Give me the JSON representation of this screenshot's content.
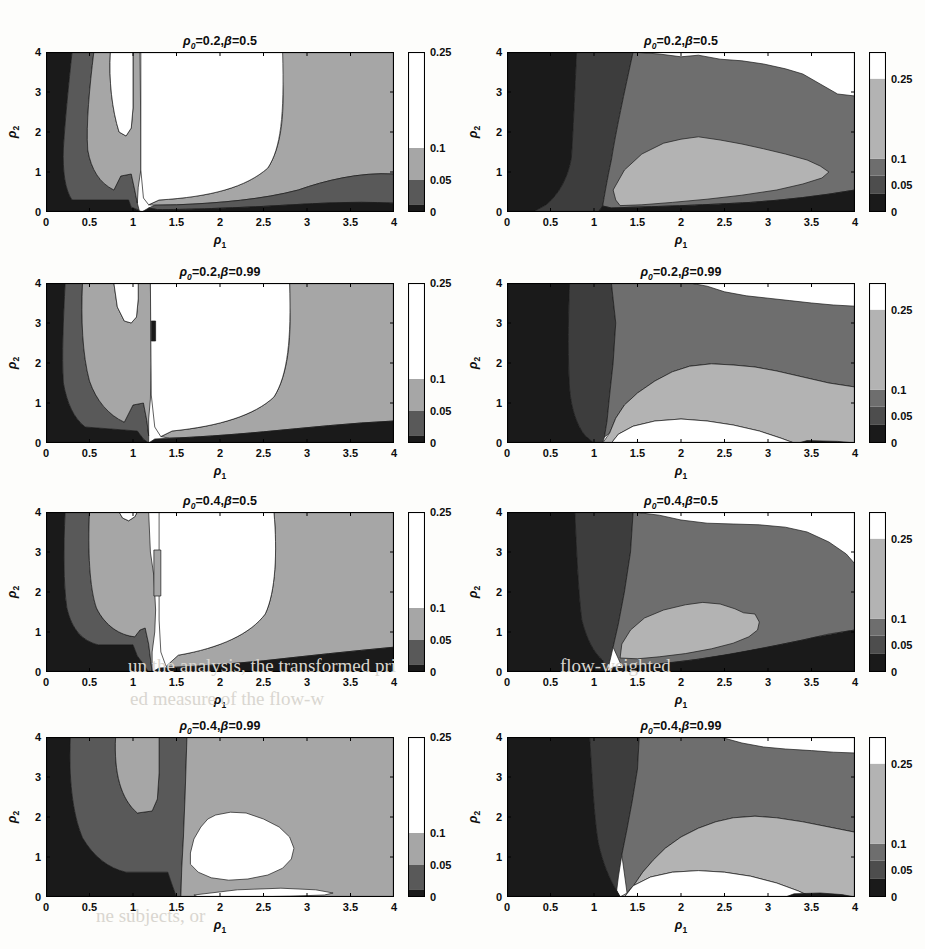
{
  "figure": {
    "width": 925,
    "height": 949,
    "background": "#fdfdfb",
    "rows": 4,
    "cols": 2
  },
  "axis": {
    "x_label": "ρ",
    "x_label_sub": "1",
    "y_label": "ρ",
    "y_label_sub": "2",
    "x_ticks": [
      "0",
      "0.5",
      "1",
      "1.5",
      "2",
      "2.5",
      "3",
      "3.5",
      "4"
    ],
    "x_tick_values": [
      0,
      0.5,
      1,
      1.5,
      2,
      2.5,
      3,
      3.5,
      4
    ],
    "y_ticks": [
      "0",
      "1",
      "2",
      "3",
      "4"
    ],
    "y_tick_values": [
      0,
      1,
      2,
      3,
      4
    ],
    "xlim": [
      0,
      4
    ],
    "ylim": [
      0,
      4
    ]
  },
  "palette": {
    "band_0": "#1a1a1a",
    "band_1": "#4d4d4d",
    "band_2": "#808080",
    "band_3": "#bfbfbf",
    "band_4": "#ffffff",
    "axis_line": "#000000",
    "contour_line": "#1a1a1a",
    "text": "#0d0d0d"
  },
  "colorbars": {
    "left": {
      "ticks": [
        "0",
        "0.05",
        "0.1",
        "0.25"
      ],
      "tick_values": [
        0,
        0.05,
        0.1,
        0.25
      ],
      "vmin": 0,
      "vmax": 0.25,
      "bands": [
        {
          "from": 0.0,
          "to": 0.012,
          "color": "#1a1a1a"
        },
        {
          "from": 0.012,
          "to": 0.05,
          "color": "#595959"
        },
        {
          "from": 0.05,
          "to": 0.1,
          "color": "#a6a6a6"
        },
        {
          "from": 0.1,
          "to": 0.25,
          "color": "#ffffff"
        }
      ]
    },
    "right": {
      "ticks": [
        "0",
        "0.05",
        "0.1",
        "0.25"
      ],
      "tick_values": [
        0,
        0.05,
        0.1,
        0.25
      ],
      "vmin": 0,
      "vmax": 0.3,
      "bands": [
        {
          "from": 0.0,
          "to": 0.035,
          "color": "#1a1a1a"
        },
        {
          "from": 0.035,
          "to": 0.068,
          "color": "#4d4d4d"
        },
        {
          "from": 0.068,
          "to": 0.1,
          "color": "#6e6e6e"
        },
        {
          "from": 0.1,
          "to": 0.25,
          "color": "#b3b3b3"
        },
        {
          "from": 0.25,
          "to": 0.3,
          "color": "#ffffff"
        }
      ]
    }
  },
  "chart_data": {
    "type": "heatmap",
    "title": "",
    "xlabel": "ρ₁",
    "ylabel": "ρ₂",
    "xlim": [
      0,
      4
    ],
    "ylim": [
      0,
      4
    ],
    "grid": false,
    "legend": "colorbar-right-of-each-panel",
    "contour_levels": [
      0,
      0.05,
      0.1,
      0.25
    ],
    "panels": [
      {
        "id": "r1c1",
        "row": 1,
        "col": 1,
        "title": "ρ₀=0.2,β=0.5",
        "rho0": 0.2,
        "beta": 0.5,
        "colorbar": "left",
        "regions": [
          {
            "level": "0-0.05",
            "color": "#1a1a1a",
            "path": "M0,4 L0.30,4 C0.26,3.2 0.22,2.3 0.20,1.6 C0.19,1.0 0.22,0.55 0.30,0.30 L0.95,0.30 L0.98,0.12 L1.06,0.05 L1.10,0 L0,0 Z"
          },
          {
            "level": "0.05-0.1",
            "color": "#595959",
            "path": "M0.30,4 L0.55,4 C0.50,3.1 0.46,2.2 0.48,1.55 C0.52,1.05 0.62,0.72 0.78,0.55 L0.86,0.90 L0.98,0.95 L1.02,0.55 L1.05,0.22 L1.07,0.05 L0.98,0.12 L0.95,0.30 L0.30,0.30 C0.22,0.55 0.19,1.0 0.20,1.6 C0.22,2.3 0.26,3.2 0.30,4 Z"
          },
          {
            "level": "0.1-0.25",
            "color": "#a6a6a6",
            "path": "M0.55,4 L0.74,4 C0.72,3.3 0.76,2.55 0.84,2.0 L0.92,1.9 L0.98,2.1 L1.00,2.6 L1.00,3.2 L1.00,4 L1.08,4 L1.09,2.0 L1.09,1.05 L1.06,0.62 L1.05,0.22 L1.02,0.55 L0.98,0.95 L0.86,0.90 L0.78,0.55 C0.62,0.72 0.52,1.05 0.48,1.55 C0.46,2.2 0.50,3.1 0.55,4 Z"
          },
          {
            "level": "0.1-0.25b",
            "color": "#a6a6a6",
            "path": "M2.70,4 L4,4 L4,0.95 C3.6,1.0 3.2,0.78 2.9,0.55 C2.5,0.32 2.0,0.22 1.5,0.18 L1.25,0.17 L1.18,0.18 L1.30,0.30 C1.9,0.38 2.3,0.62 2.55,1.1 C2.70,1.6 2.74,2.4 2.72,3.2 Z"
          },
          {
            "level": "0.05-0.1b",
            "color": "#595959",
            "path": "M4,0.95 L4,0.22 C3.5,0.28 3.0,0.2 2.5,0.14 C2.0,0.09 1.6,0.06 1.28,0.06 L1.18,0.10 L1.25,0.17 L1.5,0.18 C2.0,0.22 2.5,0.32 2.9,0.55 C3.2,0.78 3.6,1.0 4,0.95 Z"
          },
          {
            "level": "0-0.05b",
            "color": "#1a1a1a",
            "path": "M4,0.22 L4,0 L1.10,0 L1.18,0.10 L1.28,0.06 C1.6,0.06 2.0,0.09 2.5,0.14 C3.0,0.2 3.5,0.28 4,0.22 Z"
          },
          {
            "level": ">0.25",
            "color": "#ffffff",
            "path": "M0.74,4 L1.00,4 L1.00,3.2 L1.00,2.6 L0.98,2.1 L0.92,1.9 L0.84,2.0 C0.76,2.55 0.72,3.3 0.74,4 Z"
          },
          {
            "level": ">0.25b",
            "color": "#ffffff",
            "path": "M1.09,4 L2.72,4 C2.74,2.4 2.70,1.6 2.55,1.1 C2.3,0.62 1.9,0.38 1.30,0.30 L1.18,0.18 L1.12,0.35 L1.09,1.05 Z"
          }
        ]
      },
      {
        "id": "r1c2",
        "row": 1,
        "col": 2,
        "title": "ρ₀=0.2,β=0.5",
        "rho0": 0.2,
        "beta": 0.5,
        "colorbar": "right",
        "regions": [
          {
            "level": "0-0.05",
            "color": "#1a1a1a",
            "path": "M0,4 L0.80,4 C0.78,3.0 0.76,2.0 0.74,1.35 C0.70,0.85 0.60,0.45 0.45,0.18 L0.30,0 L0,0 Z"
          },
          {
            "level": "0.05-0.1",
            "color": "#3d3d3d",
            "path": "M0.80,4 L1.45,4 C1.35,3.0 1.25,2.0 1.20,1.30 C1.15,0.80 1.12,0.40 1.10,0.15 L1.05,0 L0.30,0 L0.45,0.18 C0.60,0.45 0.70,0.85 0.74,1.35 C0.76,2.0 0.78,3.0 0.80,4 Z"
          },
          {
            "level": "0.1-0.25",
            "color": "#6e6e6e",
            "path": "M1.45,4 L1.75,3.95 L2.0,3.88 L2.2,3.92 L2.45,3.82 L2.7,3.78 L2.95,3.70 L3.2,3.58 L3.4,3.45 L3.6,3.2 L3.8,2.95 L4,2.9 L4,0.55 C3.6,0.40 3.2,0.30 2.8,0.24 C2.3,0.18 1.8,0.14 1.45,0.12 L1.20,0.10 L1.10,0.15 C1.12,0.40 1.15,0.80 1.20,1.30 C1.25,2.0 1.35,3.0 1.45,4 Z"
          },
          {
            "level": "0.25+",
            "color": "#b3b3b3",
            "path": "M1.25,0.30 L1.22,0.55 L1.35,1.05 L1.55,1.45 L1.80,1.72 L2.0,1.82 L2.2,1.88 L2.45,1.80 L2.7,1.70 L2.95,1.58 L3.2,1.45 L3.45,1.30 L3.6,1.15 L3.7,1.0 L3.62,0.85 L3.4,0.70 L3.1,0.55 L2.7,0.42 L2.3,0.32 L1.9,0.24 L1.55,0.18 L1.30,0.16 Z"
          },
          {
            "level": "0-0.05c",
            "color": "#1a1a1a",
            "path": "M4,0.55 L4,0 L1.05,0 L1.10,0.15 L1.20,0.10 L1.45,0.12 C1.8,0.14 2.3,0.18 2.8,0.24 C3.2,0.30 3.6,0.40 4,0.55 Z"
          }
        ]
      },
      {
        "id": "r2c1",
        "row": 2,
        "col": 1,
        "title": "ρ₀=0.2,β=0.99",
        "rho0": 0.2,
        "beta": 0.99,
        "colorbar": "left",
        "regions": [
          {
            "level": "0-0.05",
            "color": "#1a1a1a",
            "path": "M0,4 L0.22,4 C0.20,3.1 0.18,2.2 0.20,1.5 C0.24,1.0 0.32,0.62 0.45,0.40 L1.05,0.30 L1.12,0.10 L1.18,0 L0,0 Z"
          },
          {
            "level": "0.05-0.1",
            "color": "#595959",
            "path": "M0.22,4 L0.42,4 C0.40,3.1 0.42,2.2 0.50,1.55 C0.58,1.05 0.72,0.70 0.90,0.52 L1.00,0.95 L1.12,1.0 L1.16,0.55 L1.18,0.18 L1.18,0 L1.12,0.10 L1.05,0.30 L0.45,0.40 C0.32,0.62 0.24,1.0 0.20,1.5 C0.18,2.2 0.20,3.1 0.22,4 Z"
          },
          {
            "level": "0.1-0.25",
            "color": "#a6a6a6",
            "path": "M0.42,4 L0.78,4 L0.82,3.4 L0.90,3.05 L0.98,3.0 L1.04,3.15 L1.06,3.6 L1.06,4 L1.20,4 L1.21,2.0 L1.20,1.1 L1.18,0.60 L1.18,0.18 L1.16,0.55 L1.12,1.0 L1.00,0.95 L0.90,0.52 C0.72,0.70 0.58,1.05 0.50,1.55 C0.42,2.2 0.40,3.1 0.42,4 Z"
          },
          {
            "level": "0.1-0.25b",
            "color": "#a6a6a6",
            "path": "M2.80,4 L4,4 L4,0.55 C3.5,0.50 3.0,0.38 2.5,0.28 C2.1,0.20 1.7,0.14 1.42,0.12 L1.32,0.16 L1.45,0.30 C2.0,0.42 2.4,0.70 2.62,1.15 C2.78,1.7 2.82,2.6 2.80,3.4 Z"
          },
          {
            "level": "0-0.05b",
            "color": "#1a1a1a",
            "path": "M4,0.55 L4,0 L1.18,0 L1.25,0.10 L1.42,0.12 C1.7,0.14 2.1,0.20 2.5,0.28 C3.0,0.38 3.5,0.50 4,0.55 Z"
          },
          {
            "level": ">0.25",
            "color": "#ffffff",
            "path": "M0.78,4 L1.06,4 L1.06,3.6 L1.04,3.15 L0.98,3.0 L0.90,3.05 L0.82,3.4 Z"
          },
          {
            "level": ">0.25b",
            "color": "#ffffff",
            "path": "M1.20,4 L2.80,4 C2.82,2.6 2.78,1.7 2.62,1.15 C2.4,0.70 2.0,0.42 1.45,0.30 L1.32,0.16 L1.25,0.40 L1.21,1.2 Z"
          },
          {
            "level": "spot",
            "color": "#1a1a1a",
            "path": "M1.21,2.55 L1.26,2.55 L1.26,3.05 L1.21,3.05 Z"
          }
        ]
      },
      {
        "id": "r2c2",
        "row": 2,
        "col": 2,
        "title": "ρ₀=0.2,β=0.99",
        "rho0": 0.2,
        "beta": 0.99,
        "colorbar": "right",
        "regions": [
          {
            "level": "0-0.05",
            "color": "#1a1a1a",
            "path": "M0,4 L0.72,4 C0.70,3.0 0.70,2.0 0.72,1.35 C0.74,0.85 0.80,0.45 0.90,0.18 L1.0,0 L0,0 Z"
          },
          {
            "level": "0.05-0.1",
            "color": "#3d3d3d",
            "path": "M0.72,4 L1.20,4 L1.25,3.0 L1.22,2.0 L1.18,1.20 L1.15,0.55 L1.12,0.15 L1.10,0 L1.0,0 L0.90,0.18 C0.80,0.45 0.74,0.85 0.72,1.35 C0.70,2.0 0.70,3.0 0.72,4 Z"
          },
          {
            "level": "0.1-0.25",
            "color": "#6e6e6e",
            "path": "M1.20,4 L2.1,4 L2.3,3.92 L2.5,3.78 L2.75,3.68 L3.0,3.62 L3.25,3.56 L3.5,3.50 L3.75,3.45 L4,3.42 L4,1.40 L3.7,1.50 L3.4,1.65 L3.1,1.80 L2.85,1.90 L2.6,1.95 L2.35,1.98 L2.1,1.92 L1.9,1.78 L1.7,1.55 L1.5,1.25 L1.35,0.95 L1.25,0.62 L1.18,0.25 L1.12,0.15 L1.15,0.55 L1.18,1.20 L1.22,2.0 L1.25,3.0 Z"
          },
          {
            "level": "0.25+",
            "color": "#b3b3b3",
            "path": "M1.18,0.25 L1.25,0.62 L1.35,0.95 L1.5,1.25 L1.7,1.55 L1.9,1.78 L2.1,1.92 L2.35,1.98 L2.6,1.95 L2.85,1.90 L3.1,1.80 L3.4,1.65 L3.7,1.50 L4,1.40 L4,0 L3.3,0 L3.15,0.12 L2.9,0.30 L2.6,0.45 L2.3,0.55 L2.0,0.60 L1.7,0.55 L1.45,0.42 L1.28,0.22 L1.20,0 L1.10,0 Z"
          },
          {
            "level": ">0.25",
            "color": "#ffffff",
            "path": "M1.20,0 L1.28,0.22 L1.45,0.42 L1.7,0.55 L2.0,0.60 L2.3,0.55 L2.6,0.45 L2.9,0.30 L3.15,0.12 L3.3,0 Z"
          },
          {
            "level": "0-0.05c",
            "color": "#1a1a1a",
            "path": "M3.35,0 L3.45,0.06 L3.8,0.04 L4,0 Z"
          }
        ]
      },
      {
        "id": "r3c1",
        "row": 3,
        "col": 1,
        "title": "ρ₀=0.4,β=0.5",
        "rho0": 0.4,
        "beta": 0.5,
        "colorbar": "left",
        "regions": [
          {
            "level": "0-0.05",
            "color": "#1a1a1a",
            "path": "M0,4 L0.22,4 C0.20,3.1 0.20,2.2 0.24,1.6 C0.30,1.05 0.42,0.78 0.60,0.68 L1.00,0.68 L1.05,0.40 L1.12,0.20 L1.18,0 L0,0 Z"
          },
          {
            "level": "0.05-0.1",
            "color": "#595959",
            "path": "M0.22,4 L0.50,4 C0.48,3.05 0.50,2.1 0.58,1.6 C0.68,1.15 0.85,0.92 1.02,0.88 L1.08,1.05 L1.14,1.10 L1.18,0.70 L1.20,0.35 L1.22,0 L1.18,0 L1.12,0.20 L1.05,0.40 L1.00,0.68 L0.60,0.68 C0.42,0.78 0.30,1.05 0.24,1.6 C0.20,2.2 0.20,3.1 0.22,4 Z"
          },
          {
            "level": "0.1-0.25",
            "color": "#a6a6a6",
            "path": "M0.50,4 L0.84,4 L0.88,3.85 L0.95,3.78 L1.02,3.88 L1.05,4 L1.18,4 L1.20,3.0 L1.24,2.4 L1.26,1.55 L1.25,1.0 L1.22,0.50 L1.22,0 L1.20,0.35 L1.18,0.70 L1.14,1.10 L1.08,1.05 L1.02,0.88 C0.85,0.92 0.68,1.15 0.58,1.6 C0.50,2.1 0.48,3.05 0.50,4 Z"
          },
          {
            "level": "0.1-0.25b",
            "color": "#a6a6a6",
            "path": "M2.62,4 L4,4 L4,0.62 C3.5,0.52 3.0,0.40 2.5,0.28 C2.1,0.20 1.75,0.14 1.5,0.12 L1.38,0.14 L1.52,0.42 C2.0,0.60 2.35,0.95 2.52,1.45 C2.64,2.0 2.66,3.0 2.62,4 Z"
          },
          {
            "level": "0-0.05b",
            "color": "#1a1a1a",
            "path": "M4,0.62 L4,0 L1.22,0 L1.30,0.10 L1.5,0.12 C1.75,0.14 2.1,0.20 2.5,0.28 C3.0,0.40 3.5,0.52 4,0.62 Z"
          },
          {
            "level": ">0.25",
            "color": "#ffffff",
            "path": "M0.84,4 L1.05,4 L1.02,3.88 L0.95,3.78 L0.88,3.85 Z"
          },
          {
            "level": ">0.25b",
            "color": "#ffffff",
            "path": "M1.30,4 L2.62,4 C2.66,3.0 2.64,2.0 2.52,1.45 C2.35,0.95 2.0,0.60 1.52,0.42 L1.38,0.14 L1.32,0.50 L1.30,1.3 Z"
          },
          {
            "level": "spike",
            "color": "#a6a6a6",
            "path": "M1.24,1.9 L1.32,1.9 L1.32,3.05 L1.24,3.05 Z"
          }
        ]
      },
      {
        "id": "r3c2",
        "row": 3,
        "col": 2,
        "title": "ρ₀=0.4,β=0.5",
        "rho0": 0.4,
        "beta": 0.5,
        "colorbar": "right",
        "regions": [
          {
            "level": "0-0.05",
            "color": "#1a1a1a",
            "path": "M0,4 L0.78,4 C0.80,3.0 0.82,2.0 0.86,1.30 C0.92,0.80 1.0,0.48 1.10,0.30 L1.15,0 L0,0 Z"
          },
          {
            "level": "0.05-0.1",
            "color": "#3d3d3d",
            "path": "M0.78,4 L1.45,4 L1.42,3.0 L1.35,2.0 L1.28,1.20 L1.22,0.62 L1.18,0.25 L1.15,0 L1.10,0.30 C1.0,0.48 0.92,0.80 0.86,1.30 C0.82,2.0 0.80,3.0 0.78,4 Z"
          },
          {
            "level": "0.1-0.25",
            "color": "#6e6e6e",
            "path": "M1.45,4 L1.75,3.92 L2.0,3.80 L2.3,3.72 L2.6,3.70 L2.9,3.68 L3.2,3.62 L3.45,3.50 L3.7,3.25 L3.9,2.95 L4,2.70 L4,1.05 L3.7,0.95 L3.4,0.80 L3.0,0.62 L2.6,0.45 L2.2,0.32 L1.85,0.22 L1.55,0.16 L1.32,0.14 L1.22,0.62 L1.28,1.20 L1.35,2.0 L1.42,3.0 Z"
          },
          {
            "level": "0.25+",
            "color": "#b3b3b3",
            "path": "M1.30,0.35 L1.32,0.70 L1.42,1.05 L1.58,1.35 L1.80,1.55 L2.05,1.68 L2.25,1.74 L2.45,1.70 L2.62,1.58 L2.72,1.48 L2.85,1.45 L2.9,1.25 L2.88,1.05 L2.78,0.88 L2.6,0.72 L2.35,0.58 L2.05,0.46 L1.75,0.38 L1.50,0.33 Z"
          },
          {
            "level": "0-0.05c",
            "color": "#1a1a1a",
            "path": "M4,1.05 L4,0 L1.15,0 L1.22,0.12 L1.32,0.14 C1.55,0.16 1.85,0.22 2.2,0.32 C2.6,0.45 3.0,0.62 3.4,0.80 C3.7,0.95 4,1.05 4,1.05 Z"
          }
        ]
      },
      {
        "id": "r4c1",
        "row": 4,
        "col": 1,
        "title": "ρ₀=0.4,β=0.99",
        "rho0": 0.4,
        "beta": 0.99,
        "colorbar": "left",
        "regions": [
          {
            "level": "0-0.05",
            "color": "#1a1a1a",
            "path": "M0,4 L0.28,4 C0.26,3.0 0.30,2.1 0.42,1.48 C0.55,1.0 0.72,0.72 0.92,0.62 L1.40,0.62 L1.45,0.30 L1.50,0 L0,0 Z"
          },
          {
            "level": "0.05-0.1",
            "color": "#595959",
            "path": "M0.28,4 L0.80,4 C0.78,3.1 0.86,2.45 1.05,2.10 L1.22,2.15 L1.28,2.45 L1.30,3.1 L1.30,4 L1.62,4 L1.60,2.6 L1.58,1.5 L1.56,0.70 L1.55,0 L1.50,0 L1.45,0.30 L1.40,0.62 L0.92,0.62 C0.72,0.72 0.55,1.0 0.42,1.48 C0.30,2.1 0.26,3.0 0.28,4 Z"
          },
          {
            "level": "0.1-0.25",
            "color": "#a6a6a6",
            "path": "M0.80,4 L1.30,4 L1.30,3.1 L1.28,2.45 L1.22,2.15 L1.05,2.10 C0.86,2.45 0.78,3.1 0.80,4 Z"
          },
          {
            "level": "0.1-0.25b",
            "color": "#a6a6a6",
            "path": "M1.62,4 L4,4 L4,0 L1.55,0 L1.56,0.70 L1.58,1.5 L1.60,2.6 Z"
          },
          {
            "level": ">0.25",
            "color": "#ffffff",
            "path": "M1.95,2.05 L2.12,2.12 L2.30,2.10 L2.50,1.95 L2.68,1.75 L2.80,1.50 L2.85,1.22 L2.82,0.95 L2.72,0.72 L2.55,0.55 L2.32,0.45 L2.10,0.42 L1.90,0.48 L1.75,0.62 L1.66,0.82 L1.66,1.10 L1.70,1.45 L1.78,1.75 L1.86,1.95 Z"
          },
          {
            "level": "thin",
            "color": "#ffffff",
            "path": "M1.70,0.05 L2.2,0.18 L2.7,0.22 L3.1,0.18 L3.3,0.10 L3.2,0.05 L2.8,0.02 L2.3,0 L1.75,0 Z"
          }
        ]
      },
      {
        "id": "r4c2",
        "row": 4,
        "col": 2,
        "title": "ρ₀=0.4,β=0.99",
        "rho0": 0.4,
        "beta": 0.99,
        "colorbar": "right",
        "regions": [
          {
            "level": "0-0.05",
            "color": "#1a1a1a",
            "path": "M0,4 L0.95,4 C0.98,3.0 1.0,2.0 1.05,1.35 C1.10,0.85 1.18,0.45 1.25,0.20 L1.30,0 L0,0 Z"
          },
          {
            "level": "0.05-0.1",
            "color": "#3d3d3d",
            "path": "M0.95,4 L1.52,4 L1.50,3.2 L1.44,2.4 L1.38,1.70 L1.32,1.05 L1.28,0.50 L1.26,0.15 L1.30,0 L1.25,0.20 C1.18,0.45 1.10,0.85 1.05,1.35 C1.0,2.0 0.98,3.0 0.95,4 Z"
          },
          {
            "level": "0.1-0.25",
            "color": "#6e6e6e",
            "path": "M1.52,4 L2.45,4 L2.70,3.85 L2.95,3.75 L3.2,3.70 L3.5,3.66 L3.75,3.62 L4,3.60 L4,1.62 L3.7,1.75 L3.4,1.88 L3.1,1.98 L2.85,2.02 L2.6,1.98 L2.4,1.88 L2.2,1.72 L2.0,1.50 L1.82,1.22 L1.68,0.92 L1.56,0.62 L1.46,0.30 L1.38,0.10 L1.32,1.05 L1.38,1.70 L1.44,2.4 L1.50,3.2 Z"
          },
          {
            "level": "0.25+",
            "color": "#b3b3b3",
            "path": "M1.38,0.10 L1.46,0.30 L1.56,0.62 L1.68,0.92 L1.82,1.22 L2.0,1.50 L2.2,1.72 L2.4,1.88 L2.6,1.98 L2.85,2.02 L3.1,1.98 L3.4,1.88 L3.7,1.75 L4,1.62 L4,0 L3.5,0 L3.35,0.15 L3.1,0.35 L2.8,0.52 L2.5,0.62 L2.2,0.66 L1.9,0.62 L1.65,0.50 L1.45,0.28 L1.35,0 L1.30,0 Z"
          },
          {
            "level": ">0.25",
            "color": "#ffffff",
            "path": "M1.35,0 L1.45,0.28 L1.65,0.50 L1.9,0.62 L2.2,0.66 L2.5,0.62 L2.8,0.52 L3.1,0.35 L3.35,0.15 L3.5,0 Z"
          },
          {
            "level": "0-0.05c",
            "color": "#1a1a1a",
            "path": "M3.2,0 L3.3,0.08 L3.6,0.10 L3.85,0.06 L4,0 Z"
          }
        ]
      }
    ]
  },
  "background_artifacts": [
    {
      "text": "un the analysis, the transformed pri",
      "x": 128,
      "y": 655,
      "size": 19,
      "color": "#d9d6d0"
    },
    {
      "text": "ed measure of the flow-w",
      "x": 130,
      "y": 688,
      "size": 19,
      "color": "#d9d6d0"
    },
    {
      "text": "ne subjects, or",
      "x": 96,
      "y": 905,
      "size": 19,
      "color": "#d9d6d0"
    },
    {
      "text": "flow-weighted",
      "x": 560,
      "y": 655,
      "size": 19,
      "color": "#d9d6d0"
    }
  ]
}
